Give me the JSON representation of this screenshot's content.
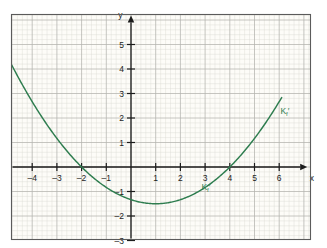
{
  "figure": {
    "background_color": "#fdfcf8",
    "frame_color": "#5b5b5b",
    "grid_minor_color": "#d8d8d2",
    "grid_major_color": "#b3b3ad",
    "axis_color": "#1c1c1c",
    "curve_color": "#2e7d4f"
  },
  "axes": {
    "x_name": "x",
    "y_name": "y",
    "x_ticks": [
      {
        "value": -4,
        "label": "–4"
      },
      {
        "value": -3,
        "label": "–3"
      },
      {
        "value": -2,
        "label": "–2"
      },
      {
        "value": -1,
        "label": "–1"
      },
      {
        "value": 1,
        "label": "1"
      },
      {
        "value": 2,
        "label": "2"
      },
      {
        "value": 3,
        "label": "3"
      },
      {
        "value": 4,
        "label": "4"
      },
      {
        "value": 5,
        "label": "5"
      },
      {
        "value": 6,
        "label": "6"
      }
    ],
    "y_ticks": [
      {
        "value": 5,
        "label": "5"
      },
      {
        "value": 4,
        "label": "4"
      },
      {
        "value": 3,
        "label": "3"
      },
      {
        "value": 2,
        "label": "2"
      },
      {
        "value": 1,
        "label": "1"
      },
      {
        "value": -1,
        "label": "–1"
      },
      {
        "value": -2,
        "label": "–2"
      },
      {
        "value": -3,
        "label": "–3"
      }
    ]
  },
  "annotations": [
    {
      "id": "upper-right",
      "text": "K",
      "sub": "f",
      "prime": "′",
      "x": 6.05,
      "y": 2.15
    },
    {
      "id": "lower-middle",
      "text": "K",
      "sub": "f",
      "prime": "′",
      "x": 2.85,
      "y": -0.95
    }
  ],
  "caption": {
    "text": ""
  },
  "chart_data": {
    "type": "line",
    "title": "",
    "xlabel": "x",
    "ylabel": "y",
    "xlim": [
      -4.85,
      7.1
    ],
    "ylim": [
      -3.55,
      5.85
    ],
    "grid": true,
    "grid_minor_step": 0.2,
    "grid_major_step": 1,
    "legend": "none",
    "series": [
      {
        "name": "Kₒ′",
        "label": "K_f'",
        "color": "#2e7d4f",
        "equation": "y = (1/6)(x + 2)(x - 4)",
        "roots": [
          -2,
          4
        ],
        "vertex": {
          "x": 1,
          "y": -1.5
        },
        "x_domain": [
          -4.85,
          6.1
        ],
        "x": [
          -4.85,
          -4.5,
          -4,
          -3.5,
          -3,
          -2.5,
          -2,
          -1.5,
          -1,
          -0.5,
          0,
          0.5,
          1,
          1.5,
          2,
          2.5,
          3,
          3.5,
          4,
          4.5,
          5,
          5.5,
          6,
          6.1
        ],
        "y": [
          3.1,
          2.54,
          2.0,
          1.5,
          1.17,
          0.75,
          0.0,
          -0.29,
          -0.83,
          -1.13,
          -1.33,
          -1.46,
          -1.5,
          -1.46,
          -1.33,
          -1.13,
          -0.83,
          -0.46,
          0.0,
          0.54,
          1.17,
          1.88,
          2.67,
          2.84
        ]
      }
    ]
  }
}
